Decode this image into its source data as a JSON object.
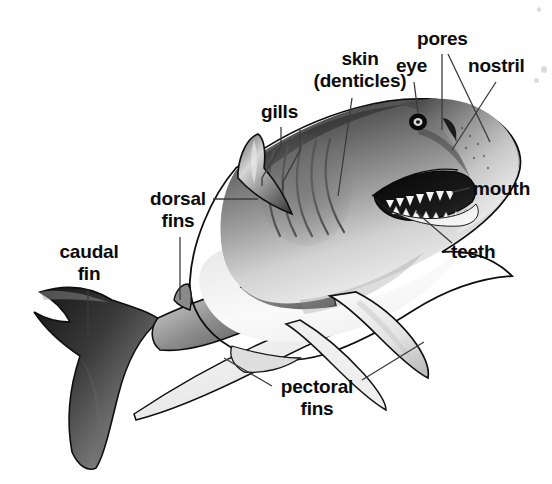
{
  "figure": {
    "background_color": "#ffffff",
    "label_color": "#0b0b0b",
    "leader_line_color": "#3c3c3c",
    "body_outline_color": "#111111"
  },
  "labels": [
    {
      "key": "skin",
      "text": "skin",
      "text2": "(denticles)",
      "x": 307,
      "y": 48,
      "w": 106
    },
    {
      "key": "pores",
      "text": "pores",
      "text2": "",
      "x": 417,
      "y": 28,
      "w": 56
    },
    {
      "key": "eye",
      "text": "eye",
      "text2": "",
      "x": 396,
      "y": 55,
      "w": 44
    },
    {
      "key": "nostril",
      "text": "nostril",
      "text2": "",
      "x": 468,
      "y": 55,
      "w": 68
    },
    {
      "key": "gills",
      "text": "gills",
      "text2": "",
      "x": 261,
      "y": 101,
      "w": 42
    },
    {
      "key": "mouth",
      "text": "mouth",
      "text2": "",
      "x": 473,
      "y": 178,
      "w": 64
    },
    {
      "key": "dorsal",
      "text": "dorsal",
      "text2": "fins",
      "x": 148,
      "y": 188,
      "w": 60
    },
    {
      "key": "teeth",
      "text": "teeth",
      "text2": "",
      "x": 451,
      "y": 241,
      "w": 50
    },
    {
      "key": "caudal",
      "text": "caudal",
      "text2": "fin",
      "x": 56,
      "y": 241,
      "w": 66
    },
    {
      "key": "pectoral",
      "text": "pectoral",
      "text2": "fins",
      "x": 276,
      "y": 376,
      "w": 82
    }
  ],
  "anatomy_parts": [
    "skin (denticles)",
    "pores",
    "eye",
    "nostril",
    "gills",
    "mouth",
    "dorsal fins",
    "teeth",
    "caudal fin",
    "pectoral fins"
  ]
}
